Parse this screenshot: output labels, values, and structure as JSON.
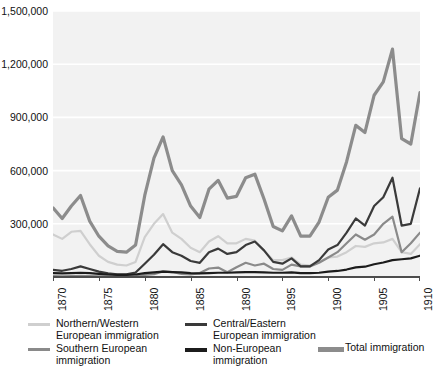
{
  "chart_data": {
    "type": "line",
    "title": "",
    "xlabel": "",
    "ylabel": "",
    "xlim": [
      1870,
      1910
    ],
    "ylim": [
      0,
      1500000
    ],
    "grid": true,
    "legend_position": "bottom",
    "y_ticks": [
      {
        "value": 1500000,
        "label": "1,500,000"
      },
      {
        "value": 1200000,
        "label": "1,200,000"
      },
      {
        "value": 900000,
        "label": "900,000"
      },
      {
        "value": 600000,
        "label": "600,000"
      },
      {
        "value": 300000,
        "label": "300,000"
      }
    ],
    "x_ticks": [
      {
        "value": 1870,
        "label": "1870"
      },
      {
        "value": 1875,
        "label": "1875"
      },
      {
        "value": 1880,
        "label": "1880"
      },
      {
        "value": 1885,
        "label": "1885"
      },
      {
        "value": 1890,
        "label": "1890"
      },
      {
        "value": 1895,
        "label": "1895"
      },
      {
        "value": 1900,
        "label": "1900"
      },
      {
        "value": 1905,
        "label": "1905"
      },
      {
        "value": 1910,
        "label": "1910"
      }
    ],
    "x": [
      1870,
      1871,
      1872,
      1873,
      1874,
      1875,
      1876,
      1877,
      1878,
      1879,
      1880,
      1881,
      1882,
      1883,
      1884,
      1885,
      1886,
      1887,
      1888,
      1889,
      1890,
      1891,
      1892,
      1893,
      1894,
      1895,
      1896,
      1897,
      1898,
      1899,
      1900,
      1901,
      1902,
      1903,
      1904,
      1905,
      1906,
      1907,
      1908,
      1909,
      1910
    ],
    "series": [
      {
        "name": "Total immigration",
        "color": "#8c8c8c",
        "width": 3.2,
        "values": [
          390000,
          330000,
          400000,
          460000,
          315000,
          230000,
          175000,
          145000,
          140000,
          180000,
          460000,
          670000,
          790000,
          600000,
          520000,
          400000,
          335000,
          495000,
          545000,
          445000,
          455000,
          560000,
          580000,
          440000,
          285000,
          260000,
          345000,
          230000,
          230000,
          310000,
          450000,
          490000,
          650000,
          855000,
          815000,
          1025000,
          1100000,
          1285000,
          780000,
          750000,
          1040000
        ]
      },
      {
        "name": "Northern/Western European immigration",
        "color": "#cfcfcf",
        "width": 2.2,
        "values": [
          240000,
          215000,
          255000,
          260000,
          185000,
          120000,
          85000,
          70000,
          65000,
          85000,
          225000,
          300000,
          355000,
          250000,
          215000,
          165000,
          140000,
          200000,
          230000,
          190000,
          190000,
          215000,
          205000,
          150000,
          95000,
          95000,
          110000,
          70000,
          65000,
          85000,
          110000,
          115000,
          140000,
          175000,
          170000,
          190000,
          195000,
          215000,
          140000,
          130000,
          185000
        ]
      },
      {
        "name": "Central/Eastern European immigration",
        "color": "#3a3a3a",
        "width": 2.2,
        "values": [
          40000,
          35000,
          45000,
          60000,
          45000,
          30000,
          20000,
          15000,
          15000,
          25000,
          75000,
          125000,
          185000,
          140000,
          120000,
          90000,
          80000,
          140000,
          160000,
          130000,
          140000,
          180000,
          200000,
          150000,
          85000,
          75000,
          105000,
          60000,
          60000,
          95000,
          155000,
          180000,
          250000,
          330000,
          290000,
          400000,
          450000,
          560000,
          290000,
          300000,
          500000
        ]
      },
      {
        "name": "Southern European immigration",
        "color": "#8a8a8a",
        "width": 2.2,
        "values": [
          5000,
          4000,
          5000,
          6000,
          5000,
          4000,
          3000,
          2500,
          2500,
          4000,
          12000,
          16000,
          32000,
          28000,
          18000,
          14000,
          22000,
          48000,
          53000,
          27000,
          55000,
          80000,
          65000,
          75000,
          45000,
          40000,
          70000,
          60000,
          60000,
          80000,
          110000,
          140000,
          190000,
          240000,
          210000,
          240000,
          300000,
          340000,
          140000,
          190000,
          250000
        ]
      },
      {
        "name": "Non-European immigration",
        "color": "#1c1c1c",
        "width": 2.2,
        "values": [
          22000,
          20000,
          22000,
          24000,
          22000,
          18000,
          14000,
          12000,
          12000,
          14000,
          22000,
          26000,
          30000,
          28000,
          26000,
          22000,
          20000,
          22000,
          24000,
          24000,
          26000,
          28000,
          28000,
          26000,
          24000,
          24000,
          26000,
          22000,
          22000,
          24000,
          30000,
          34000,
          42000,
          54000,
          58000,
          72000,
          82000,
          95000,
          100000,
          105000,
          120000
        ]
      }
    ]
  },
  "legend": {
    "entries": [
      {
        "key": "nw",
        "label": "Northern/Western\nEuropean immigration",
        "color": "#cfcfcf",
        "thickness": 3
      },
      {
        "key": "se",
        "label": "Southern European\nimmigration",
        "color": "#8a8a8a",
        "thickness": 3
      },
      {
        "key": "ce",
        "label": "Central/Eastern\nEuropean immigration",
        "color": "#3a3a3a",
        "thickness": 3
      },
      {
        "key": "ne",
        "label": "Non-European\nimmigration",
        "color": "#1c1c1c",
        "thickness": 4
      },
      {
        "key": "tot",
        "label": "Total immigration",
        "color": "#8c8c8c",
        "thickness": 5
      }
    ]
  },
  "style": {
    "plot_background": "#f2f2f2",
    "gridline_color": "#ffffff",
    "axis_color": "#4d4d4d",
    "page_background": "#ffffff"
  }
}
